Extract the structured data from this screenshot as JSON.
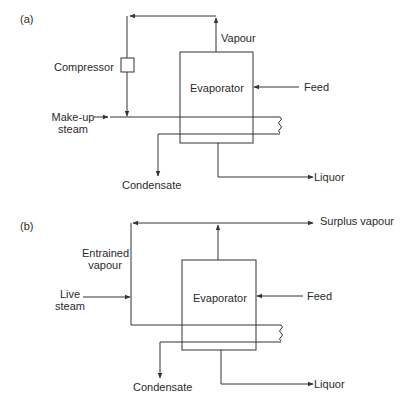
{
  "figure": {
    "panel_a": {
      "tag": "(a)",
      "labels": {
        "compressor": "Compressor",
        "evaporator": "Evaporator",
        "vapour": "Vapour",
        "feed": "Feed",
        "makeup_line1": "Make-up",
        "makeup_line2": "steam",
        "condensate": "Condensate",
        "liquor": "Liquor"
      }
    },
    "panel_b": {
      "tag": "(b)",
      "labels": {
        "surplus_vapour": "Surplus vapour",
        "entrained_line1": "Entrained",
        "entrained_line2": "vapour",
        "live_line1": "Live",
        "live_line2": "steam",
        "evaporator": "Evaporator",
        "feed": "Feed",
        "condensate": "Condensate",
        "liquor": "Liquor"
      }
    },
    "colors": {
      "line": "#333333",
      "background": "#ffffff"
    }
  }
}
